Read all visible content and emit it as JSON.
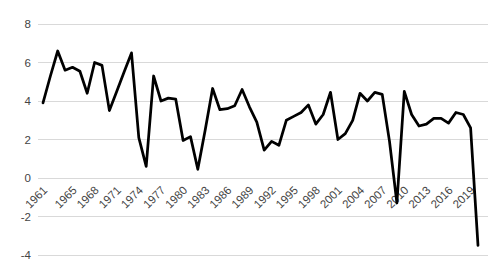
{
  "chart_data": {
    "type": "line",
    "title": "",
    "xlabel": "",
    "ylabel": "",
    "x": [
      1961,
      1962,
      1963,
      1964,
      1965,
      1966,
      1967,
      1968,
      1969,
      1970,
      1971,
      1972,
      1973,
      1974,
      1975,
      1976,
      1977,
      1978,
      1979,
      1980,
      1981,
      1982,
      1983,
      1984,
      1985,
      1986,
      1987,
      1988,
      1989,
      1990,
      1991,
      1992,
      1993,
      1994,
      1995,
      1996,
      1997,
      1998,
      1999,
      2000,
      2001,
      2002,
      2003,
      2004,
      2005,
      2006,
      2007,
      2008,
      2009,
      2010,
      2011,
      2012,
      2013,
      2014,
      2015,
      2016,
      2017,
      2018,
      2019,
      2020
    ],
    "values": [
      3.9,
      5.3,
      6.6,
      5.6,
      5.75,
      5.55,
      4.4,
      6.0,
      5.85,
      3.5,
      4.5,
      5.5,
      6.5,
      2.1,
      0.6,
      5.3,
      4.0,
      4.15,
      4.1,
      1.95,
      2.15,
      0.45,
      2.5,
      4.65,
      3.55,
      3.6,
      3.75,
      4.6,
      3.7,
      2.9,
      1.45,
      1.9,
      1.7,
      3.0,
      3.2,
      3.4,
      3.8,
      2.8,
      3.3,
      4.45,
      2.0,
      2.3,
      3.0,
      4.4,
      4.0,
      4.45,
      4.35,
      1.9,
      -1.3,
      4.5,
      3.3,
      2.7,
      2.8,
      3.1,
      3.1,
      2.85,
      3.4,
      3.3,
      2.6,
      -3.5
    ],
    "y_ticks": [
      8,
      6,
      4,
      2,
      0,
      -2,
      -4
    ],
    "y_tick_labels": [
      "8",
      "6",
      "4",
      "2",
      "0",
      "-2",
      "-4"
    ],
    "x_tick_years": [
      1961,
      1965,
      1968,
      1971,
      1974,
      1977,
      1980,
      1983,
      1986,
      1989,
      1992,
      1995,
      1998,
      2001,
      2004,
      2007,
      2010,
      2013,
      2016,
      2019
    ],
    "x_tick_labels": [
      "1961",
      "1965",
      "1968",
      "1971",
      "1974",
      "1977",
      "1980",
      "1983",
      "1986",
      "1989",
      "1992",
      "1995",
      "1998",
      "2001",
      "2004",
      "2007",
      "2010",
      "2013",
      "2016",
      "2019"
    ],
    "ylim": [
      -4,
      8
    ],
    "grid": true,
    "legend": "none",
    "line_color": "#000000",
    "gridline_color": "#d9d9d9",
    "label_color": "#444444",
    "background_color": "#ffffff"
  }
}
